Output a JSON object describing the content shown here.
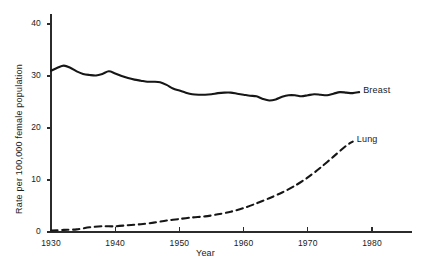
{
  "chart_data": {
    "type": "line",
    "title": "",
    "xlabel": "Year",
    "ylabel": "Rate per 100,000 female population",
    "xlim": [
      1930,
      1983
    ],
    "ylim": [
      0,
      42
    ],
    "xticks": [
      1930,
      1940,
      1950,
      1960,
      1970,
      1980
    ],
    "xtick_labels": [
      "1930",
      "1940",
      "1950",
      "1960",
      "1970",
      "1980"
    ],
    "yticks": [
      0,
      10,
      20,
      30,
      40
    ],
    "ytick_labels": [
      "0",
      "10",
      "20",
      "30",
      "40"
    ],
    "grid": false,
    "legend_position": "inline-right-of-line-end",
    "series": [
      {
        "name": "Breast",
        "style": "solid",
        "color": "#161616",
        "label": "Breast",
        "x": [
          1930,
          1931,
          1932,
          1933,
          1934,
          1935,
          1936,
          1937,
          1938,
          1939,
          1940,
          1941,
          1942,
          1943,
          1944,
          1945,
          1946,
          1947,
          1948,
          1949,
          1950,
          1951,
          1952,
          1953,
          1954,
          1955,
          1956,
          1957,
          1958,
          1959,
          1960,
          1961,
          1962,
          1963,
          1964,
          1965,
          1966,
          1967,
          1968,
          1969,
          1970,
          1971,
          1972,
          1973,
          1974,
          1975,
          1976,
          1977,
          1978
        ],
        "values": [
          31.0,
          31.6,
          32.0,
          31.6,
          30.9,
          30.4,
          30.2,
          30.1,
          30.4,
          30.9,
          30.5,
          30.0,
          29.6,
          29.3,
          29.1,
          28.9,
          28.9,
          28.8,
          28.3,
          27.6,
          27.2,
          26.8,
          26.5,
          26.4,
          26.4,
          26.5,
          26.7,
          26.8,
          26.8,
          26.6,
          26.4,
          26.2,
          26.1,
          25.6,
          25.3,
          25.5,
          26.0,
          26.3,
          26.3,
          26.1,
          26.3,
          26.5,
          26.4,
          26.3,
          26.6,
          26.9,
          26.8,
          26.7,
          26.9
        ]
      },
      {
        "name": "Lung",
        "style": "dashed",
        "color": "#161616",
        "label": "Lung",
        "x": [
          1930,
          1932,
          1934,
          1936,
          1938,
          1940,
          1942,
          1944,
          1946,
          1948,
          1950,
          1952,
          1954,
          1956,
          1958,
          1960,
          1962,
          1964,
          1966,
          1968,
          1970,
          1972,
          1974,
          1976,
          1977
        ],
        "values": [
          0.3,
          0.4,
          0.5,
          0.9,
          1.1,
          1.1,
          1.3,
          1.5,
          1.8,
          2.2,
          2.5,
          2.8,
          3.0,
          3.4,
          3.9,
          4.6,
          5.5,
          6.5,
          7.6,
          8.9,
          10.5,
          12.4,
          14.5,
          16.6,
          17.4
        ]
      }
    ],
    "labels": {
      "breast_label": "Breast",
      "lung_label": "Lung"
    }
  },
  "axes": {
    "x_axis_name": "year-axis",
    "y_axis_name": "rate-axis"
  }
}
